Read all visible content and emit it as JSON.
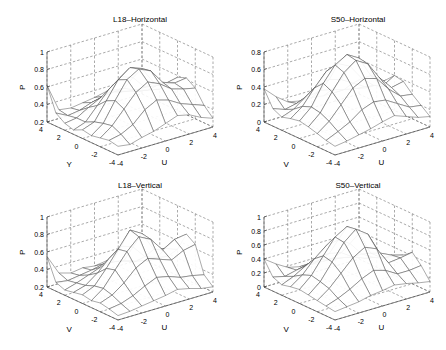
{
  "chart_data": [
    {
      "type": "surface",
      "title": "L18–Horizontal",
      "xlabel": "U",
      "ylabel": "Y",
      "zlabel": "P",
      "x_ticks": [
        "-4",
        "-2",
        "0",
        "2",
        "4"
      ],
      "y_ticks": [
        "4",
        "2",
        "0",
        "-2",
        "-4"
      ],
      "z_ticks": [
        "0.2",
        "0.4",
        "0.6",
        "0.8",
        "1"
      ],
      "zlim": [
        0.2,
        1.0
      ],
      "grid": true,
      "x": [
        -4,
        -3,
        -2,
        -1,
        0,
        1,
        2,
        3,
        4
      ],
      "y": [
        -4,
        -3,
        -2,
        -1,
        0,
        1,
        2,
        3,
        4
      ],
      "z": [
        [
          0.3,
          0.28,
          0.32,
          0.35,
          0.4,
          0.45,
          0.42,
          0.35,
          0.3
        ],
        [
          0.32,
          0.35,
          0.42,
          0.55,
          0.62,
          0.58,
          0.5,
          0.45,
          0.4
        ],
        [
          0.3,
          0.4,
          0.55,
          0.7,
          0.78,
          0.72,
          0.62,
          0.58,
          0.55
        ],
        [
          0.28,
          0.38,
          0.6,
          0.8,
          0.88,
          0.82,
          0.65,
          0.6,
          0.62
        ],
        [
          0.3,
          0.35,
          0.55,
          0.75,
          0.85,
          0.8,
          0.6,
          0.55,
          0.58
        ],
        [
          0.25,
          0.3,
          0.45,
          0.6,
          0.7,
          0.65,
          0.5,
          0.48,
          0.45
        ],
        [
          0.28,
          0.3,
          0.38,
          0.45,
          0.5,
          0.48,
          0.42,
          0.38,
          0.35
        ],
        [
          0.35,
          0.28,
          0.3,
          0.35,
          0.38,
          0.4,
          0.36,
          0.32,
          0.3
        ],
        [
          0.62,
          0.3,
          0.28,
          0.3,
          0.32,
          0.35,
          0.3,
          0.28,
          0.26
        ]
      ]
    },
    {
      "type": "surface",
      "title": "S50–Horizontal",
      "xlabel": "U",
      "ylabel": "V",
      "zlabel": "P",
      "x_ticks": [
        "-4",
        "-2",
        "0",
        "2",
        "4"
      ],
      "y_ticks": [
        "4",
        "2",
        "0",
        "-2",
        "-4"
      ],
      "z_ticks": [
        "0",
        "0.2",
        "0.4",
        "0.6",
        "0.8"
      ],
      "zlim": [
        0,
        0.8
      ],
      "grid": true,
      "x": [
        -4,
        -3,
        -2,
        -1,
        0,
        1,
        2,
        3,
        4
      ],
      "y": [
        -4,
        -3,
        -2,
        -1,
        0,
        1,
        2,
        3,
        4
      ],
      "z": [
        [
          0.1,
          0.12,
          0.15,
          0.18,
          0.22,
          0.25,
          0.2,
          0.15,
          0.12
        ],
        [
          0.12,
          0.18,
          0.25,
          0.35,
          0.4,
          0.38,
          0.3,
          0.22,
          0.2
        ],
        [
          0.15,
          0.25,
          0.4,
          0.55,
          0.62,
          0.58,
          0.42,
          0.3,
          0.28
        ],
        [
          0.18,
          0.3,
          0.5,
          0.68,
          0.78,
          0.7,
          0.5,
          0.35,
          0.38
        ],
        [
          0.2,
          0.32,
          0.55,
          0.72,
          0.8,
          0.72,
          0.48,
          0.32,
          0.4
        ],
        [
          0.18,
          0.28,
          0.45,
          0.6,
          0.65,
          0.58,
          0.4,
          0.28,
          0.3
        ],
        [
          0.15,
          0.2,
          0.3,
          0.4,
          0.42,
          0.38,
          0.3,
          0.22,
          0.2
        ],
        [
          0.2,
          0.15,
          0.18,
          0.22,
          0.25,
          0.22,
          0.18,
          0.15,
          0.12
        ],
        [
          0.38,
          0.25,
          0.15,
          0.12,
          0.12,
          0.1,
          0.1,
          0.1,
          0.1
        ]
      ]
    },
    {
      "type": "surface",
      "title": "L18–Vertical",
      "xlabel": "U",
      "ylabel": "V",
      "zlabel": "P",
      "x_ticks": [
        "-4",
        "-2",
        "0",
        "2",
        "4"
      ],
      "y_ticks": [
        "4",
        "2",
        "0",
        "-2",
        "-4"
      ],
      "z_ticks": [
        "0.2",
        "0.4",
        "0.6",
        "0.8",
        "1"
      ],
      "zlim": [
        0.2,
        1.0
      ],
      "grid": true,
      "x": [
        -4,
        -3,
        -2,
        -1,
        0,
        1,
        2,
        3,
        4
      ],
      "y": [
        -4,
        -3,
        -2,
        -1,
        0,
        1,
        2,
        3,
        4
      ],
      "z": [
        [
          0.25,
          0.26,
          0.28,
          0.3,
          0.32,
          0.35,
          0.32,
          0.28,
          0.26
        ],
        [
          0.28,
          0.3,
          0.35,
          0.42,
          0.48,
          0.45,
          0.4,
          0.38,
          0.35
        ],
        [
          0.3,
          0.35,
          0.45,
          0.58,
          0.65,
          0.6,
          0.55,
          0.62,
          0.65
        ],
        [
          0.28,
          0.38,
          0.55,
          0.72,
          0.85,
          0.78,
          0.62,
          0.7,
          0.72
        ],
        [
          0.3,
          0.36,
          0.52,
          0.7,
          0.88,
          0.8,
          0.58,
          0.55,
          0.5
        ],
        [
          0.28,
          0.32,
          0.42,
          0.55,
          0.65,
          0.6,
          0.45,
          0.4,
          0.38
        ],
        [
          0.26,
          0.3,
          0.35,
          0.4,
          0.42,
          0.4,
          0.35,
          0.32,
          0.3
        ],
        [
          0.3,
          0.28,
          0.3,
          0.32,
          0.35,
          0.34,
          0.3,
          0.28,
          0.26
        ],
        [
          0.55,
          0.32,
          0.28,
          0.3,
          0.28,
          0.3,
          0.28,
          0.26,
          0.25
        ]
      ]
    },
    {
      "type": "surface",
      "title": "S50–Vertical",
      "xlabel": "U",
      "ylabel": "V",
      "zlabel": "P",
      "x_ticks": [
        "-4",
        "-2",
        "0",
        "2",
        "4"
      ],
      "y_ticks": [
        "4",
        "2",
        "0",
        "-2",
        "-4"
      ],
      "z_ticks": [
        "0",
        "0.2",
        "0.4",
        "0.6",
        "0.8",
        "1"
      ],
      "zlim": [
        0,
        1.0
      ],
      "grid": true,
      "x": [
        -4,
        -3,
        -2,
        -1,
        0,
        1,
        2,
        3,
        4
      ],
      "y": [
        -4,
        -3,
        -2,
        -1,
        0,
        1,
        2,
        3,
        4
      ],
      "z": [
        [
          0.12,
          0.14,
          0.16,
          0.2,
          0.22,
          0.25,
          0.22,
          0.18,
          0.15
        ],
        [
          0.14,
          0.2,
          0.28,
          0.38,
          0.45,
          0.4,
          0.3,
          0.3,
          0.32
        ],
        [
          0.16,
          0.28,
          0.45,
          0.62,
          0.72,
          0.65,
          0.4,
          0.42,
          0.45
        ],
        [
          0.18,
          0.32,
          0.55,
          0.78,
          0.92,
          0.8,
          0.48,
          0.4,
          0.35
        ],
        [
          0.2,
          0.35,
          0.58,
          0.8,
          0.9,
          0.75,
          0.42,
          0.3,
          0.28
        ],
        [
          0.18,
          0.3,
          0.48,
          0.62,
          0.65,
          0.55,
          0.35,
          0.25,
          0.2
        ],
        [
          0.15,
          0.22,
          0.32,
          0.4,
          0.4,
          0.36,
          0.25,
          0.18,
          0.15
        ],
        [
          0.2,
          0.16,
          0.2,
          0.24,
          0.25,
          0.22,
          0.18,
          0.14,
          0.12
        ],
        [
          0.4,
          0.28,
          0.18,
          0.14,
          0.12,
          0.12,
          0.1,
          0.1,
          0.1
        ]
      ]
    }
  ]
}
